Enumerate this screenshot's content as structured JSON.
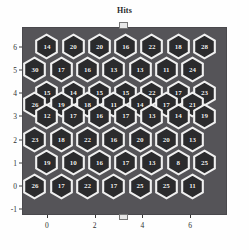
{
  "chart_data": {
    "type": "heatmap",
    "title": "Hits",
    "xlabel": "",
    "ylabel": "",
    "xlim": [
      -1,
      7.5
    ],
    "ylim": [
      -1.2,
      6.8
    ],
    "xticks": [
      0,
      2,
      4,
      6
    ],
    "yticks": [
      6,
      5,
      4,
      3,
      2,
      1,
      0,
      -1
    ],
    "xtick_labels": [
      "0",
      "2",
      "4",
      "6"
    ],
    "ytick_labels": [
      "6",
      "5",
      "4",
      "3",
      "2",
      "1",
      "0",
      "-1"
    ],
    "grid": false,
    "legend": "none",
    "background_color": "#555458",
    "hex_fill_color": "#2b2b2d",
    "hex_edge_color": "#f0f0f0",
    "label_color": "#f2f2f2",
    "rows": [
      {
        "y": 6,
        "x_start": 0,
        "values": [
          14,
          20,
          20,
          16,
          22,
          18,
          28
        ]
      },
      {
        "y": 5,
        "x_start": -0.5,
        "values": [
          30,
          17,
          16,
          13,
          13,
          11,
          24
        ]
      },
      {
        "y": 4,
        "x_start": 0,
        "values": [
          15,
          14,
          15,
          15,
          22,
          17,
          23
        ]
      },
      {
        "y": 3.5,
        "x_start": -0.5,
        "values": [
          26,
          19,
          18,
          11,
          14,
          17,
          21
        ]
      },
      {
        "y": 3,
        "x_start": 0,
        "values": [
          12,
          17,
          16,
          17,
          13,
          14,
          19
        ]
      },
      {
        "y": 2,
        "x_start": -0.5,
        "values": [
          23,
          18,
          22,
          16,
          20,
          20,
          13
        ]
      },
      {
        "y": 1,
        "x_start": 0,
        "values": [
          19,
          10,
          16,
          17,
          13,
          8,
          25
        ]
      },
      {
        "y": 0,
        "x_start": -0.5,
        "values": [
          26,
          17,
          22,
          17,
          25,
          25,
          11
        ]
      }
    ],
    "values_flat": [
      14,
      20,
      20,
      16,
      22,
      18,
      28,
      30,
      17,
      16,
      13,
      13,
      11,
      24,
      15,
      14,
      15,
      15,
      22,
      17,
      23,
      26,
      19,
      18,
      11,
      14,
      17,
      21,
      12,
      17,
      16,
      17,
      13,
      14,
      19,
      23,
      18,
      22,
      16,
      20,
      20,
      13,
      19,
      10,
      16,
      17,
      13,
      8,
      25,
      26,
      17,
      22,
      17,
      25,
      25,
      11
    ],
    "value_min": 8,
    "value_max": 30,
    "n_cells": 56
  }
}
